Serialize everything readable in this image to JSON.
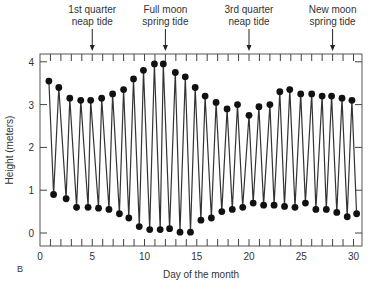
{
  "figure_label": "B",
  "chart_data": {
    "type": "line",
    "title": "",
    "xlabel": "Day of the month",
    "ylabel": "Height (meters)",
    "xlim": [
      0,
      31
    ],
    "ylim": [
      -0.3,
      4.2
    ],
    "xticks": [
      0,
      5,
      10,
      15,
      20,
      25,
      30
    ],
    "yticks": [
      0,
      1,
      2,
      3,
      4
    ],
    "grid": false,
    "annotations": [
      {
        "text_line1": "1st quarter",
        "text_line2": "neap tide",
        "day": 5
      },
      {
        "text_line1": "Full moon",
        "text_line2": "spring tide",
        "day": 12
      },
      {
        "text_line1": "3rd quarter",
        "text_line2": "neap tide",
        "day": 20
      },
      {
        "text_line1": "New moon",
        "text_line2": "spring tide",
        "day": 28
      }
    ],
    "series": [
      {
        "name": "High tides",
        "x": [
          0.85,
          1.8,
          2.85,
          3.9,
          4.85,
          5.9,
          6.95,
          8.0,
          8.95,
          9.9,
          10.95,
          11.8,
          12.95,
          13.9,
          14.85,
          15.8,
          16.85,
          17.9,
          18.9,
          20.0,
          20.95,
          22.0,
          22.95,
          23.9,
          24.95,
          26.0,
          27.0,
          27.9,
          28.9,
          29.85
        ],
        "values": [
          3.55,
          3.4,
          3.15,
          3.1,
          3.1,
          3.15,
          3.25,
          3.35,
          3.6,
          3.8,
          3.95,
          3.95,
          3.75,
          3.65,
          3.4,
          3.2,
          3.05,
          2.9,
          3.0,
          2.75,
          2.95,
          3.0,
          3.3,
          3.35,
          3.25,
          3.25,
          3.2,
          3.2,
          3.15,
          3.1
        ]
      },
      {
        "name": "Low tides",
        "x": [
          1.3,
          2.5,
          3.5,
          4.6,
          5.6,
          6.6,
          7.6,
          8.5,
          9.5,
          10.5,
          11.5,
          12.4,
          13.4,
          14.4,
          15.4,
          16.4,
          17.4,
          18.4,
          19.4,
          20.4,
          21.4,
          22.4,
          23.4,
          24.4,
          25.4,
          26.4,
          27.4,
          28.4,
          29.4,
          30.3
        ],
        "values": [
          0.9,
          0.8,
          0.6,
          0.6,
          0.58,
          0.55,
          0.45,
          0.35,
          0.15,
          0.08,
          0.08,
          0.1,
          0.02,
          0.02,
          0.3,
          0.35,
          0.5,
          0.55,
          0.6,
          0.7,
          0.65,
          0.65,
          0.62,
          0.6,
          0.7,
          0.55,
          0.55,
          0.48,
          0.38,
          0.45
        ]
      }
    ]
  }
}
